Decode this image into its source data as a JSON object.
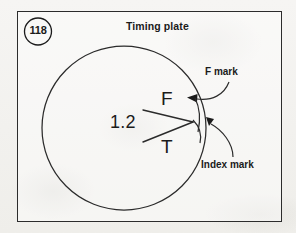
{
  "figure": {
    "number": "118",
    "title": "Timing plate",
    "background_color": "#f4f3f1",
    "ink_color": "#1b1b1b",
    "frame_color": "#2c2c2c"
  },
  "plate": {
    "marks": {
      "f_glyph": "F",
      "t_glyph": "T",
      "value": "1.2"
    }
  },
  "callouts": [
    {
      "label": "F mark",
      "arrow": "arrowhead-left"
    },
    {
      "label": "Index mark",
      "arrow": "arrowhead-down"
    }
  ],
  "icons": {
    "figure-badge": "circled-number",
    "timing-plate": "large-circle",
    "timing-marks": "converging-tick-lines"
  }
}
